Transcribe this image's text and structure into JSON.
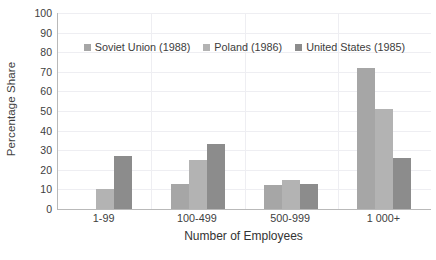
{
  "chart_data": {
    "type": "bar",
    "title": "",
    "xlabel": "Number of Employees",
    "ylabel": "Percentage Share",
    "categories": [
      "1-99",
      "100-499",
      "500-999",
      "1 000+"
    ],
    "ylim": [
      0,
      100
    ],
    "yticks": [
      100,
      90,
      80,
      70,
      60,
      50,
      40,
      30,
      20,
      10,
      0
    ],
    "grid": true,
    "legend_position": "top-center",
    "series": [
      {
        "name": "Soviet Union (1988)",
        "color": "#a6a6a6",
        "values": [
          0,
          13,
          12,
          72
        ]
      },
      {
        "name": "Poland (1986)",
        "color": "#b3b3b3",
        "values": [
          10,
          25,
          15,
          51
        ]
      },
      {
        "name": "United States (1985)",
        "color": "#8c8c8c",
        "values": [
          27,
          33,
          13,
          26
        ]
      }
    ]
  },
  "colors": {
    "axis": "#b9b9b9",
    "grid": "#eeeef2",
    "text": "#404040",
    "background": "#ffffff"
  }
}
